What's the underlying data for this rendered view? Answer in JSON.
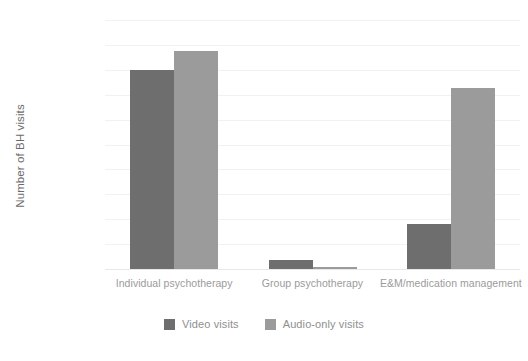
{
  "chart_data": {
    "type": "bar",
    "title": "",
    "xlabel": "",
    "ylabel": "Number of BH visits",
    "ylim": [
      0,
      100000
    ],
    "ytick_step": 10000,
    "grid": true,
    "legend_position": "bottom",
    "categories": [
      "Individual psychotherapy",
      "Group psychotherapy",
      "E&M/medication management"
    ],
    "ytick_labels": [
      "100,000",
      "90,000",
      "80,000",
      "70,000",
      "60,000",
      "50,000",
      "40,000",
      "30,000",
      "20,000",
      "10,000",
      "0"
    ],
    "series": [
      {
        "name": "Video visits",
        "color": "#6e6e6e",
        "values": [
          80000,
          3500,
          18000
        ]
      },
      {
        "name": "Audio-only visits",
        "color": "#9b9b9b",
        "values": [
          87500,
          800,
          72500
        ]
      }
    ]
  },
  "colors": {
    "video": "#6e6e6e",
    "audio": "#9b9b9b",
    "gridline": "#f1f1f3",
    "axis_text": "#9b9b9b",
    "background": "#ffffff"
  }
}
